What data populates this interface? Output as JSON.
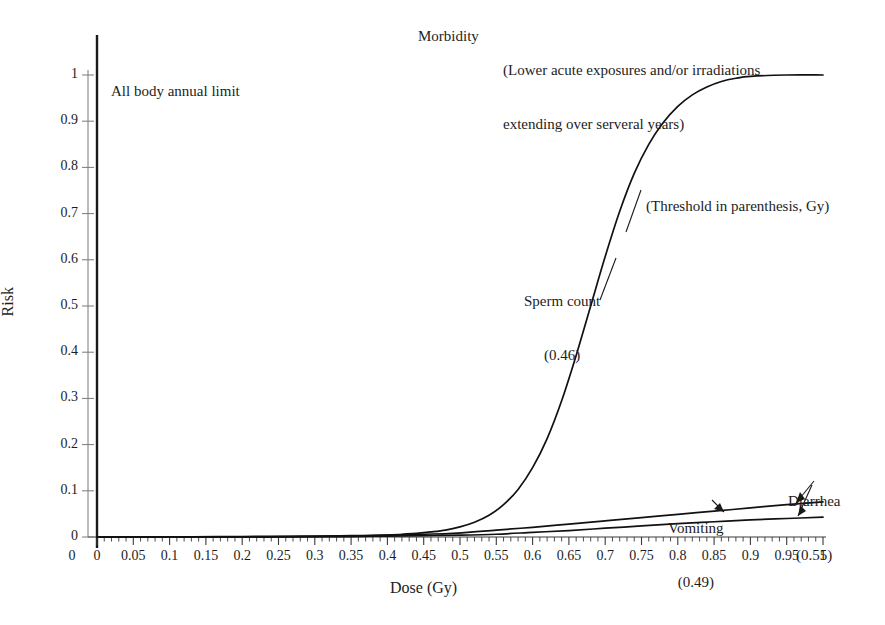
{
  "chart_data": {
    "type": "line",
    "title": "",
    "xlabel": "Dose (Gy)",
    "ylabel": "Risk",
    "xlim": [
      0,
      1
    ],
    "ylim": [
      0,
      1
    ],
    "grid": false,
    "legend_position": "inline-annotations",
    "x_ticks": [
      "0",
      "0.05",
      "0.1",
      "0.15",
      "0.2",
      "0.25",
      "0.3",
      "0.35",
      "0.4",
      "0.45",
      "0.5",
      "0.55",
      "0.6",
      "0.65",
      "0.7",
      "0.75",
      "0.8",
      "0.85",
      "0.9",
      "0.95",
      "1"
    ],
    "x_tick_values": [
      0,
      0.05,
      0.1,
      0.15,
      0.2,
      0.25,
      0.3,
      0.35,
      0.4,
      0.45,
      0.5,
      0.55,
      0.6,
      0.65,
      0.7,
      0.75,
      0.8,
      0.85,
      0.9,
      0.95,
      1
    ],
    "y_ticks": [
      "0",
      "0.1",
      "0.2",
      "0.3",
      "0.4",
      "0.5",
      "0.6",
      "0.7",
      "0.8",
      "0.9",
      "1"
    ],
    "y_tick_values": [
      0,
      0.1,
      0.2,
      0.3,
      0.4,
      0.5,
      0.6,
      0.7,
      0.8,
      0.9,
      1
    ],
    "minor_ticks_per_major_x": 5,
    "series": [
      {
        "name": "Sperm count",
        "threshold": 0.46,
        "label": "Sperm count",
        "threshold_label": "(0.46)",
        "color": "#111111",
        "x": [
          0.0,
          0.05,
          0.1,
          0.15,
          0.2,
          0.25,
          0.3,
          0.35,
          0.4,
          0.42,
          0.44,
          0.46,
          0.48,
          0.5,
          0.52,
          0.54,
          0.56,
          0.58,
          0.6,
          0.62,
          0.64,
          0.66,
          0.68,
          0.7,
          0.72,
          0.74,
          0.76,
          0.78,
          0.8,
          0.82,
          0.84,
          0.86,
          0.88,
          0.9,
          0.95,
          1.0
        ],
        "y": [
          0.0,
          0.0,
          0.0,
          0.0,
          0.0,
          0.0,
          0.001,
          0.002,
          0.004,
          0.006,
          0.008,
          0.011,
          0.015,
          0.022,
          0.032,
          0.047,
          0.07,
          0.103,
          0.15,
          0.213,
          0.295,
          0.393,
          0.5,
          0.607,
          0.705,
          0.787,
          0.85,
          0.897,
          0.932,
          0.957,
          0.974,
          0.986,
          0.993,
          0.997,
          1.0,
          1.0
        ]
      },
      {
        "name": "Vomiting",
        "threshold": 0.49,
        "label": "Vomiting",
        "threshold_label": "(0.49)",
        "color": "#111111",
        "x": [
          0.0,
          0.1,
          0.2,
          0.3,
          0.35,
          0.4,
          0.45,
          0.49,
          0.55,
          0.6,
          0.65,
          0.7,
          0.75,
          0.8,
          0.85,
          0.9,
          0.95,
          1.0
        ],
        "y": [
          0.0,
          0.0,
          0.001,
          0.002,
          0.003,
          0.004,
          0.006,
          0.008,
          0.015,
          0.021,
          0.028,
          0.035,
          0.042,
          0.049,
          0.056,
          0.063,
          0.07,
          0.076
        ]
      },
      {
        "name": "Diarrhea",
        "threshold": 0.55,
        "label": "Diarrhea",
        "threshold_label": "(0.55)",
        "color": "#111111",
        "x": [
          0.0,
          0.1,
          0.2,
          0.3,
          0.35,
          0.4,
          0.45,
          0.5,
          0.55,
          0.6,
          0.65,
          0.7,
          0.75,
          0.8,
          0.85,
          0.9,
          0.95,
          1.0
        ],
        "y": [
          0.0,
          0.0,
          0.0,
          0.001,
          0.001,
          0.002,
          0.003,
          0.004,
          0.006,
          0.01,
          0.014,
          0.019,
          0.024,
          0.029,
          0.033,
          0.037,
          0.04,
          0.043
        ]
      }
    ],
    "annotations": [
      {
        "name": "morbidity",
        "text": "Morbidity"
      },
      {
        "name": "subtitle",
        "text": "(Lower acute exposures and/or irradiations\nextending over serveral years)"
      },
      {
        "name": "all-body-annual-limit",
        "text": "All body annual limit"
      },
      {
        "name": "threshold-note",
        "text": "(Threshold in parenthesis, Gy)"
      }
    ]
  },
  "labels": {
    "morbidity": "Morbidity",
    "subtitle_line1": "(Lower acute exposures and/or irradiations",
    "subtitle_line2": "extending over serveral years)",
    "all_body_annual_limit": "All body annual limit",
    "threshold_note": "(Threshold in parenthesis, Gy)",
    "sperm_count": "Sperm count",
    "sperm_count_threshold": "(0.46)",
    "vomiting": "Vomiting",
    "vomiting_threshold": "(0.49)",
    "diarrhea": "Diarrhea",
    "diarrhea_threshold": "(0.55)",
    "x_axis": "Dose (Gy)",
    "y_axis": "Risk"
  },
  "colors": {
    "background": "#ffffff",
    "curve": "#111111",
    "axis": "#6b6b6b",
    "limit_line": "#1a1a1a",
    "text": "#1d1d1d"
  }
}
